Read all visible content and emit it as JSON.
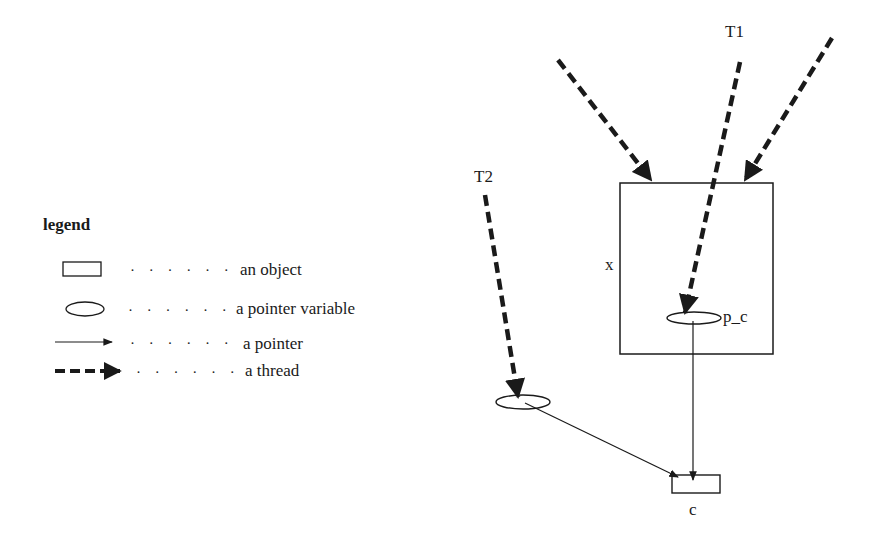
{
  "legend": {
    "title": "legend",
    "leader": "· · · · · ·",
    "items": [
      {
        "symbol": "rectangle",
        "label": "an object"
      },
      {
        "symbol": "ellipse",
        "label": "a pointer variable"
      },
      {
        "symbol": "thin-arrow",
        "label": "a pointer"
      },
      {
        "symbol": "thick-dashed-arrow",
        "label": "a thread"
      }
    ]
  },
  "diagram": {
    "threads": [
      {
        "label": "T1",
        "target": "p_c"
      },
      {
        "label": "T2",
        "target": "T2 pointer variable"
      },
      {
        "label": "",
        "target": "x"
      },
      {
        "label": "",
        "target": "x"
      }
    ],
    "objects": [
      {
        "label": "x"
      },
      {
        "label": "c"
      }
    ],
    "pointer_variables": [
      {
        "label": "p_c",
        "points_to": "c"
      },
      {
        "label": "",
        "points_to": "c"
      }
    ],
    "colors": {
      "ink": "#1a1a1a",
      "background": "#ffffff"
    }
  }
}
